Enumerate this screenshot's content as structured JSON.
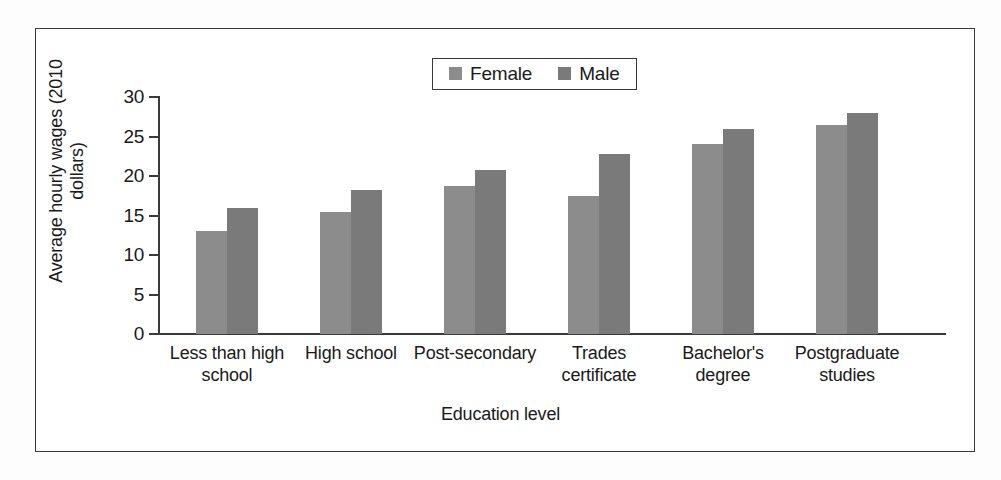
{
  "figure": {
    "background": "#ffffff",
    "frame_color": "#3a3a3a"
  },
  "legend": {
    "position": "top-center",
    "entries": [
      {
        "label": "Female",
        "color": "#8c8c8c",
        "icon": "legend-swatch-icon"
      },
      {
        "label": "Male",
        "color": "#7a7a7a",
        "icon": "legend-swatch-icon"
      }
    ]
  },
  "axes": {
    "y_title": "Average hourly wages\n(2010 dollars)",
    "x_title": "Education level",
    "y_ticks": [
      "30",
      "25",
      "20",
      "15",
      "10",
      "5",
      "0"
    ]
  },
  "chart_data": {
    "type": "bar",
    "title": "",
    "subtitle": "",
    "xlabel": "Education level",
    "ylabel": "Average hourly wages (2010 dollars)",
    "ylim": [
      0,
      30
    ],
    "yticks": [
      0,
      5,
      10,
      15,
      20,
      25,
      30
    ],
    "grid": false,
    "legend_position": "top-center",
    "categories": [
      "Less than high\nschool",
      "High school",
      "Post-secondary",
      "Trades\ncertificate",
      "Bachelor's\ndegree",
      "Postgraduate\nstudies"
    ],
    "series": [
      {
        "name": "Female",
        "color": "#8c8c8c",
        "values": [
          13.0,
          15.5,
          18.7,
          17.5,
          24.0,
          26.5
        ]
      },
      {
        "name": "Male",
        "color": "#7a7a7a",
        "values": [
          16.0,
          18.2,
          20.7,
          22.8,
          26.0,
          28.0
        ]
      }
    ]
  }
}
